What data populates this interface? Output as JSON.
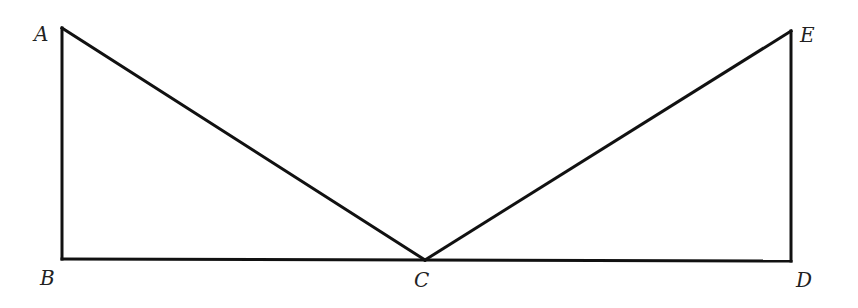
{
  "diagram": {
    "type": "geometry",
    "stroke_color": "#111111",
    "label_color": "#222222",
    "points": {
      "A": {
        "label": "A",
        "x": 62,
        "y": 28,
        "label_x": 34,
        "label_y": 41
      },
      "B": {
        "label": "B",
        "x": 62,
        "y": 259,
        "label_x": 40,
        "label_y": 285
      },
      "C": {
        "label": "C",
        "x": 425,
        "y": 260,
        "label_x": 414,
        "label_y": 287
      },
      "D": {
        "label": "D",
        "x": 791,
        "y": 261,
        "label_x": 796,
        "label_y": 287
      },
      "E": {
        "label": "E",
        "x": 791,
        "y": 31,
        "label_x": 800,
        "label_y": 42
      }
    },
    "segments": [
      [
        "A",
        "B"
      ],
      [
        "A",
        "C"
      ],
      [
        "B",
        "C"
      ],
      [
        "C",
        "D"
      ],
      [
        "C",
        "E"
      ],
      [
        "E",
        "D"
      ]
    ]
  }
}
